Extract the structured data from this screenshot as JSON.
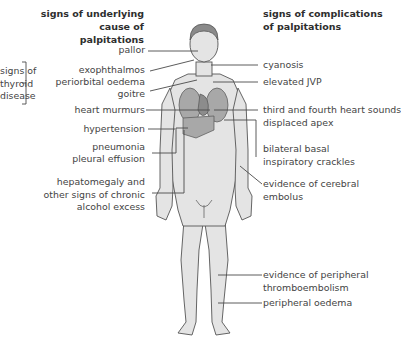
{
  "left_header": {
    "line1": "signs of underlying",
    "line2": "cause of palpitations"
  },
  "right_header": {
    "line1": "signs of complications",
    "line2": "of palpitations"
  },
  "thyroid_group": {
    "line1": "signs of",
    "line2": "thyroid",
    "line3": "disease"
  },
  "left_labels": {
    "pallor": "pallor",
    "exophthalmos": "exophthalmos",
    "periorbital": "periorbital oedema",
    "goitre": "goitre",
    "murmurs": "heart murmurs",
    "hypertension": "hypertension",
    "pneumonia": "pneumonia",
    "effusion": "pleural effusion",
    "hep1": "hepatomegaly and",
    "hep2": "other signs of chronic",
    "hep3": "alcohol excess"
  },
  "right_labels": {
    "cyanosis": "cyanosis",
    "jvp": "elevated JVP",
    "heart_sounds": "third and fourth heart sounds",
    "apex": "displaced apex",
    "crackles1": "bilateral  basal",
    "crackles2": "inspiratory crackles",
    "cerebral1": "evidence of cerebral",
    "cerebral2": "embolus",
    "thrombo1": "evidence of peripheral",
    "thrombo2": "thromboembolism",
    "oedema": "peripheral oedema"
  },
  "colors": {
    "skin": "#e4e4e4",
    "outline": "#555555",
    "organ": "#a8a8a8",
    "hair": "#8a8a8a",
    "line": "#4a4a4a"
  }
}
